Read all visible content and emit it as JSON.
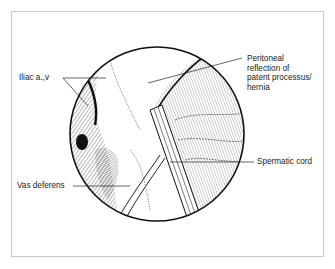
{
  "figure": {
    "type": "anatomical illustration",
    "view": "circular laparoscopic view",
    "colors": {
      "ink": "#222222",
      "frame": "#c8c8c8",
      "background": "#ffffff"
    }
  },
  "labels": {
    "iliac": "Iliac a.,v",
    "peritoneal": "Peritoneal\nreflection of\npatent processus/\nhernia",
    "spermatic": "Spermatic cord",
    "vas": "Vas deferens"
  }
}
